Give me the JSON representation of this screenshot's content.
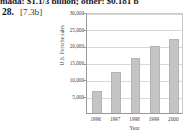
{
  "page": {
    "cut_off_header_text": "mada: $1.1/3 billion; other: $0.181 b",
    "exercise_number": "28.",
    "answer_tag": "[7.3b]"
  },
  "chart_data": {
    "type": "bar",
    "title": "",
    "xlabel": "Year",
    "ylabel": "U.S. Porsche sales",
    "categories": [
      "1996",
      "1997",
      "1998",
      "1999",
      "2000"
    ],
    "values": [
      7000,
      12700,
      17000,
      20500,
      22700
    ],
    "ylim": [
      0,
      30000
    ],
    "ytick_values": [
      5000,
      10000,
      15000,
      20000,
      25000,
      30000
    ],
    "ytick_labels": [
      "5,000",
      "10,000",
      "15,000",
      "20,000",
      "25,000",
      "30,000"
    ],
    "grid": true,
    "legend": "none",
    "bar_color": "#c4c4c4",
    "bar_edge_color": "#b4b4b4",
    "grid_color": "#d8d8d8",
    "axis_color": "#9a9a9a"
  }
}
